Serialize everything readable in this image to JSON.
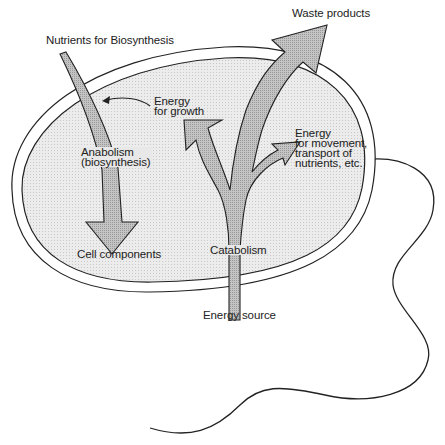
{
  "diagram": {
    "colors": {
      "background": "#ffffff",
      "cytoplasm": "#e6e6e6",
      "arrow_fill": "#bdbdbd",
      "stroke": "#222222"
    },
    "labels": {
      "waste_products": "Waste products",
      "nutrients": "Nutrients for Biosynthesis",
      "energy_growth_line1": "Energy",
      "energy_growth_line2": "for growth",
      "energy_movement_line1": "Energy",
      "energy_movement_line2": "for movement,",
      "energy_movement_line3": "transport of",
      "energy_movement_line4": "nutrients, etc.",
      "anabolism_line1": "Anabolism",
      "anabolism_line2": "(biosynthesis)",
      "cell_components": "Cell components",
      "catabolism": "Catabolism",
      "energy_source": "Energy source"
    },
    "shapes": {
      "cell": "oval-cell-with-double-membrane",
      "flagellum": "wavy-flagellum",
      "arrows": [
        "anabolism-arrow",
        "catabolism-trunk-arrow",
        "waste-products-arrow",
        "energy-for-growth-arrow",
        "energy-for-movement-arrow",
        "thin-energy-pointer-arrow"
      ]
    }
  }
}
